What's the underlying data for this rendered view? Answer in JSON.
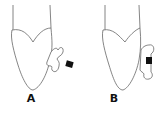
{
  "figure": {
    "panels": [
      {
        "id": "A",
        "label": "A",
        "description": "tooth with bracket attached, bracket offset"
      },
      {
        "id": "B",
        "label": "B",
        "description": "tooth with bracket attached flush"
      }
    ]
  },
  "colors": {
    "stroke": "#555555",
    "fill_marker": "#111111",
    "background": "#ffffff"
  }
}
